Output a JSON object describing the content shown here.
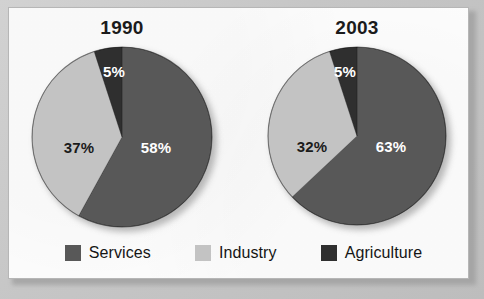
{
  "colors": {
    "services": "#585858",
    "industry": "#c3c3c3",
    "agriculture": "#2f2f2f",
    "page_background": "#c9c9c9",
    "panel_background": "#fdfdfd",
    "panel_border": "#b6b6b6",
    "label_light": "#ffffff",
    "label_dark": "#1b1b1b"
  },
  "legend": {
    "items": [
      {
        "label": "Services",
        "color_key": "services",
        "swatch": "legend-swatch-services"
      },
      {
        "label": "Industry",
        "color_key": "industry",
        "swatch": "legend-swatch-industry"
      },
      {
        "label": "Agriculture",
        "color_key": "agriculture",
        "swatch": "legend-swatch-agriculture"
      }
    ]
  },
  "charts": [
    {
      "title": "1990",
      "labels": [
        "58%",
        "37%",
        "5%"
      ]
    },
    {
      "title": "2003",
      "labels": [
        "63%",
        "32%",
        "5%"
      ]
    }
  ],
  "chart_data": [
    {
      "type": "pie",
      "title": "1990",
      "categories": [
        "Services",
        "Industry",
        "Agriculture"
      ],
      "values": [
        58,
        37,
        5
      ],
      "value_labels": [
        "58%",
        "37%",
        "5%"
      ],
      "colors": [
        "#585858",
        "#c3c3c3",
        "#2f2f2f"
      ],
      "units": "percent",
      "start_angle_deg": 0,
      "direction": "clockwise",
      "legend": "bottom, shared",
      "xlabel": "",
      "ylabel": ""
    },
    {
      "type": "pie",
      "title": "2003",
      "categories": [
        "Services",
        "Industry",
        "Agriculture"
      ],
      "values": [
        63,
        32,
        5
      ],
      "value_labels": [
        "63%",
        "32%",
        "5%"
      ],
      "colors": [
        "#585858",
        "#c3c3c3",
        "#2f2f2f"
      ],
      "units": "percent",
      "start_angle_deg": 0,
      "direction": "clockwise",
      "legend": "bottom, shared",
      "xlabel": "",
      "ylabel": ""
    }
  ]
}
